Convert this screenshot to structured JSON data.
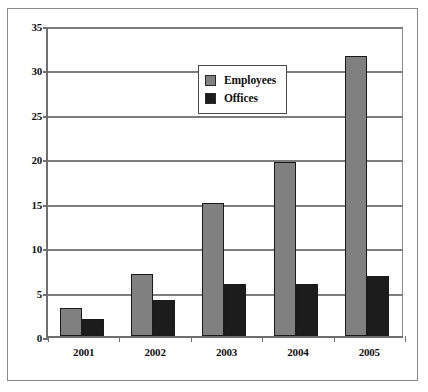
{
  "chart_data": {
    "type": "bar",
    "title": "",
    "xlabel": "",
    "ylabel": "",
    "categories": [
      "2001",
      "2002",
      "2003",
      "2004",
      "2005"
    ],
    "series": [
      {
        "name": "Employees",
        "color": "#808080",
        "values": [
          3.2,
          7.0,
          15.0,
          19.6,
          31.5
        ]
      },
      {
        "name": "Offices",
        "color": "#1c1c1c",
        "values": [
          1.9,
          4.0,
          5.9,
          5.8,
          6.7
        ]
      }
    ],
    "ylim": [
      0,
      35
    ],
    "yticks": [
      0,
      5,
      10,
      15,
      20,
      25,
      30,
      35
    ],
    "ytick_labels": [
      "0",
      "5",
      "10",
      "15",
      "20",
      "25",
      "30",
      "35"
    ],
    "grid": true,
    "legend_position": "top-center",
    "legend_entries": [
      "Employees",
      "Offices"
    ]
  }
}
